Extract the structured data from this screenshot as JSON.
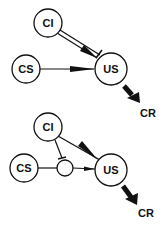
{
  "diagrams": [
    {
      "nodes": {
        "ci": "CI",
        "cs": "CS",
        "us": "US",
        "cr": "CR"
      },
      "edges": [
        {
          "from": "CI",
          "to": "US",
          "type": "excitatory-and-inhibitory"
        },
        {
          "from": "CS",
          "to": "US",
          "type": "excitatory"
        },
        {
          "from": "US",
          "to": "CR",
          "type": "output"
        }
      ]
    },
    {
      "nodes": {
        "ci": "CI",
        "cs": "CS",
        "us": "US",
        "cr": "CR",
        "gate": ""
      },
      "edges": [
        {
          "from": "CI",
          "to": "US",
          "type": "excitatory"
        },
        {
          "from": "CI",
          "to": "gate",
          "type": "inhibitory"
        },
        {
          "from": "CS",
          "to": "gate",
          "type": "line"
        },
        {
          "from": "gate",
          "to": "US",
          "type": "excitatory"
        },
        {
          "from": "US",
          "to": "CR",
          "type": "output"
        }
      ]
    }
  ],
  "colors": {
    "stroke": "#111111",
    "background": "#ffffff"
  }
}
